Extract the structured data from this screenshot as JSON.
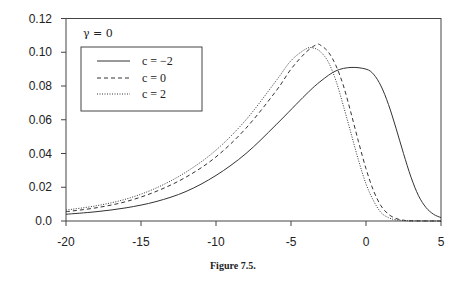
{
  "chart_data": {
    "type": "line",
    "title": "",
    "caption": "Figure 7.5.",
    "annotation": "γ = 0",
    "xlabel": "",
    "ylabel": "",
    "xlim": [
      -20,
      5
    ],
    "ylim": [
      0,
      0.12
    ],
    "xticks": [
      -20,
      -15,
      -10,
      -5,
      0,
      5
    ],
    "xtick_labels": [
      "-20",
      "-15",
      "-10",
      "-5",
      "0",
      "5"
    ],
    "yticks": [
      0,
      0.02,
      0.04,
      0.06,
      0.08,
      0.1,
      0.12
    ],
    "ytick_labels": [
      "0.0",
      "0.02",
      "0.04",
      "0.06",
      "0.08",
      "0.10",
      "0.12"
    ],
    "grid": false,
    "legend_position": "upper left",
    "series": [
      {
        "name": "c = −2",
        "style": "solid",
        "x": [
          -20,
          -18,
          -16,
          -14,
          -12,
          -10,
          -8,
          -6,
          -4,
          -3,
          -2,
          -1,
          0,
          0.5,
          1,
          1.5,
          2,
          2.5,
          3,
          3.5,
          4,
          4.5,
          5
        ],
        "y": [
          0.004,
          0.0055,
          0.0078,
          0.0115,
          0.0175,
          0.027,
          0.04,
          0.057,
          0.075,
          0.083,
          0.089,
          0.091,
          0.09,
          0.087,
          0.08,
          0.069,
          0.055,
          0.04,
          0.026,
          0.015,
          0.008,
          0.004,
          0.002
        ]
      },
      {
        "name": "c = 0",
        "style": "dashed",
        "x": [
          -20,
          -18,
          -16,
          -14,
          -12,
          -10,
          -8,
          -6,
          -5,
          -4,
          -3.3,
          -3,
          -2.5,
          -2,
          -1.5,
          -1,
          -0.5,
          0,
          0.5,
          1,
          1.5,
          2,
          2.5,
          3,
          5
        ],
        "y": [
          0.0055,
          0.0078,
          0.0115,
          0.0175,
          0.026,
          0.038,
          0.055,
          0.077,
          0.09,
          0.1,
          0.1045,
          0.104,
          0.1,
          0.092,
          0.08,
          0.064,
          0.047,
          0.031,
          0.018,
          0.009,
          0.004,
          0.0015,
          0.0005,
          0.0001,
          0
        ]
      },
      {
        "name": "c = 2",
        "style": "dotted",
        "x": [
          -20,
          -18,
          -16,
          -14,
          -12,
          -10,
          -8,
          -6,
          -5,
          -4,
          -3.5,
          -3,
          -2.5,
          -2,
          -1.5,
          -1,
          -0.5,
          0,
          0.5,
          1,
          1.5,
          2,
          3,
          5
        ],
        "y": [
          0.0065,
          0.009,
          0.013,
          0.0195,
          0.029,
          0.042,
          0.06,
          0.083,
          0.095,
          0.102,
          0.1025,
          0.1,
          0.094,
          0.083,
          0.068,
          0.052,
          0.036,
          0.022,
          0.012,
          0.005,
          0.002,
          0.0007,
          0.0001,
          0
        ]
      }
    ]
  }
}
